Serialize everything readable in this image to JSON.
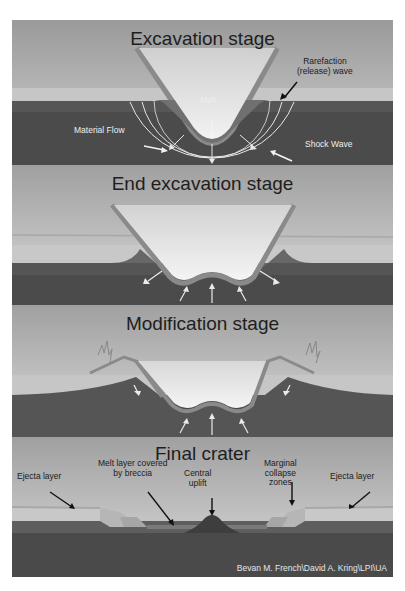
{
  "figure": {
    "type": "impact crater formation stages",
    "panels": [
      {
        "id": "excavation",
        "title": "Excavation stage",
        "labels": {
          "rarefaction_line1": "Rarefaction",
          "rarefaction_line2": "(release) wave",
          "melt": "Melt",
          "material_flow": "Material Flow",
          "shock_wave": "Shock Wave"
        }
      },
      {
        "id": "end-excavation",
        "title": "End excavation stage"
      },
      {
        "id": "modification",
        "title": "Modification stage"
      },
      {
        "id": "final",
        "title": "Final crater",
        "labels": {
          "ejecta_left": "Ejecta layer",
          "melt_layer_line1": "Melt layer covered",
          "melt_layer_line2": "by breccia",
          "central_line1": "Central",
          "central_line2": "uplift",
          "marginal_line1": "Marginal",
          "marginal_line2": "collapse",
          "marginal_line3": "zones",
          "ejecta_right": "Ejecta layer"
        },
        "credit": "Bevan M. French\\David A. Kring\\LPI\\UA"
      }
    ],
    "colors": {
      "sky_top": "#9c9c9c",
      "sky_bottom": "#d4d4d4",
      "upper_layer": "#c4c4c4",
      "mid_rock": "#5a5a5a",
      "deep_rock": "#4a4a4a",
      "crater_lining": "#8a8a8a",
      "arrow_light": "#f0f0f0",
      "arrow_dark": "#111111"
    }
  }
}
